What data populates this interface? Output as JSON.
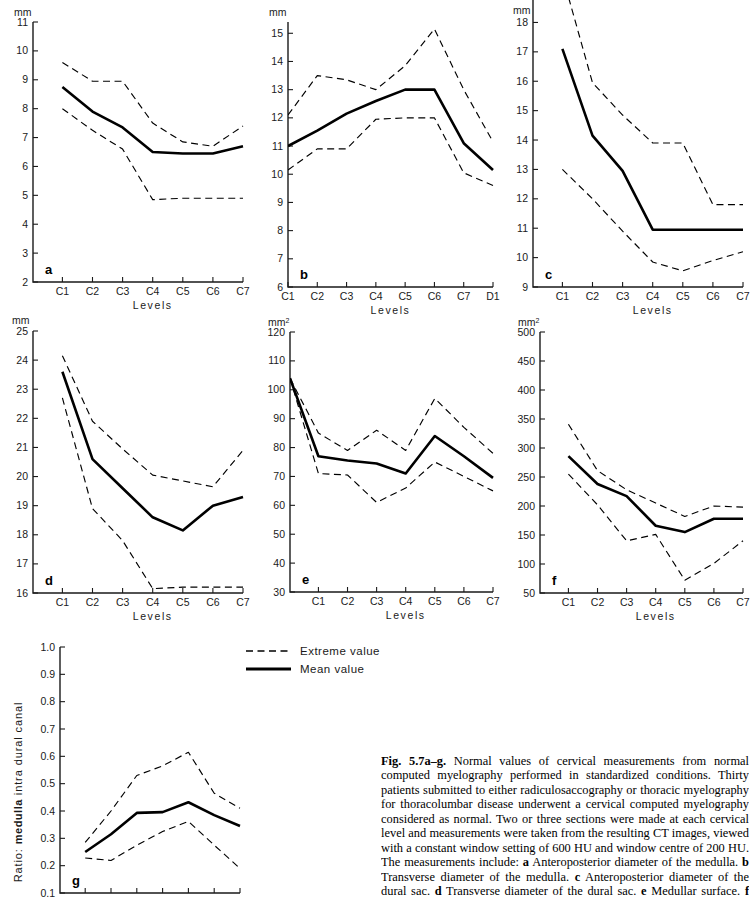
{
  "legend": {
    "extreme_label": "Extreme value",
    "mean_label": "Mean value"
  },
  "caption": {
    "figure_number": "Fig. 5.7a–g.",
    "text": " Normal values of cervical measurements from normal computed myelography performed in standardized conditions. Thirty patients submitted to either radiculosaccography or thoracic myelography for thoracolumbar disease underwent a cervical computed myelography considered as normal. Two or three sections were made at each cervical level and measurements were taken from the resulting CT images, viewed with a constant window setting of 600 HU and window centre of 200 HU. The measurements include: ",
    "items": [
      {
        "letter": "a",
        "text": " Anteroposterior diameter of the medulla. "
      },
      {
        "letter": "b",
        "text": " Transverse diameter of the medulla. "
      },
      {
        "letter": "c",
        "text": " Anteroposterior diameter of the dural sac. "
      },
      {
        "letter": "d",
        "text": " Transverse diameter of the dural sac. "
      },
      {
        "letter": "e",
        "text": " Medullar surface. "
      },
      {
        "letter": "f",
        "text": " Intradural canalar surface."
      }
    ]
  },
  "chart_data": [
    {
      "id": "a",
      "type": "line",
      "panel_letter": "a",
      "unit": "mm",
      "xlabel": "Levels",
      "ylabel": "",
      "categories": [
        "C1",
        "C2",
        "C3",
        "C4",
        "C5",
        "C6",
        "C7"
      ],
      "ylim": [
        2,
        11
      ],
      "yticks": [
        2,
        3,
        4,
        5,
        6,
        7,
        8,
        9,
        10,
        11
      ],
      "ytick_labels": [
        "2",
        "3",
        "4",
        "5",
        "6",
        "7",
        "8",
        "9",
        "10",
        "11"
      ],
      "grid": false,
      "series": [
        {
          "name": "Extreme value upper",
          "style": "dashed",
          "values": [
            9.6,
            8.95,
            8.95,
            7.5,
            6.85,
            6.7,
            7.4
          ]
        },
        {
          "name": "Mean value",
          "style": "solid",
          "values": [
            8.75,
            7.9,
            7.35,
            6.5,
            6.45,
            6.45,
            6.7
          ]
        },
        {
          "name": "Extreme value lower",
          "style": "dashed",
          "values": [
            8.0,
            7.25,
            6.6,
            4.85,
            4.9,
            4.9,
            4.9
          ]
        }
      ]
    },
    {
      "id": "b",
      "type": "line",
      "panel_letter": "b",
      "unit": "mm",
      "xlabel": "Levels",
      "ylabel": "",
      "categories": [
        "C1",
        "C2",
        "C3",
        "C4",
        "C5",
        "C6",
        "C7",
        "D1"
      ],
      "ylim": [
        6,
        15.4
      ],
      "yticks": [
        6,
        7,
        8,
        9,
        10,
        11,
        12,
        13,
        14,
        15
      ],
      "ytick_labels": [
        "6",
        "7",
        "8",
        "9",
        "10",
        "11",
        "12",
        "13",
        "14",
        "15"
      ],
      "grid": false,
      "series": [
        {
          "name": "Extreme value upper",
          "style": "dashed",
          "values": [
            12.1,
            13.5,
            13.35,
            13.0,
            13.85,
            15.15,
            13.0,
            11.15
          ]
        },
        {
          "name": "Mean value",
          "style": "solid",
          "values": [
            11.0,
            11.55,
            12.15,
            12.6,
            13.0,
            13.0,
            11.1,
            10.15
          ]
        },
        {
          "name": "Extreme value lower",
          "style": "dashed",
          "values": [
            10.15,
            10.9,
            10.9,
            11.95,
            12.0,
            12.0,
            10.05,
            9.6
          ]
        }
      ]
    },
    {
      "id": "c",
      "type": "line",
      "panel_letter": "c",
      "unit": "mm",
      "xlabel": "Levels",
      "ylabel": "",
      "categories": [
        "C1",
        "C2",
        "C3",
        "C4",
        "C5",
        "C6",
        "C7"
      ],
      "ylim": [
        9,
        18.9
      ],
      "yticks": [
        9,
        10,
        11,
        12,
        13,
        14,
        15,
        16,
        17,
        18
      ],
      "ytick_labels": [
        "9",
        "10",
        "11",
        "12",
        "13",
        "14",
        "15",
        "16",
        "17",
        "18"
      ],
      "grid": false,
      "series": [
        {
          "name": "Extreme value upper",
          "style": "dashed",
          "values": [
            19.6,
            15.95,
            14.85,
            13.9,
            13.9,
            11.8,
            11.8
          ]
        },
        {
          "name": "Mean value",
          "style": "solid",
          "values": [
            17.1,
            14.15,
            12.95,
            10.95,
            10.95,
            10.95,
            10.95
          ]
        },
        {
          "name": "Extreme value lower",
          "style": "dashed",
          "values": [
            13.0,
            12.0,
            10.9,
            9.85,
            9.55,
            9.9,
            10.2
          ]
        }
      ]
    },
    {
      "id": "d",
      "type": "line",
      "panel_letter": "d",
      "unit": "mm",
      "xlabel": "Levels",
      "ylabel": "",
      "categories": [
        "C1",
        "C2",
        "C3",
        "C4",
        "C5",
        "C6",
        "C7"
      ],
      "ylim": [
        16,
        25
      ],
      "yticks": [
        16,
        17,
        18,
        19,
        20,
        21,
        22,
        23,
        24,
        25
      ],
      "ytick_labels": [
        "16",
        "17",
        "18",
        "19",
        "20",
        "21",
        "22",
        "23",
        "24",
        "25"
      ],
      "grid": false,
      "series": [
        {
          "name": "Extreme value upper",
          "style": "dashed",
          "values": [
            24.15,
            21.9,
            20.95,
            20.05,
            19.85,
            19.65,
            20.9
          ]
        },
        {
          "name": "Mean value",
          "style": "solid",
          "values": [
            23.6,
            20.6,
            19.6,
            18.6,
            18.15,
            19.0,
            19.3
          ]
        },
        {
          "name": "Extreme value lower",
          "style": "dashed",
          "values": [
            22.7,
            18.9,
            17.8,
            16.15,
            16.2,
            16.2,
            16.2
          ]
        }
      ]
    },
    {
      "id": "e",
      "type": "line",
      "panel_letter": "e",
      "unit": "mm2",
      "xlabel": "Levels",
      "ylabel": "",
      "categories": [
        "C1",
        "C2",
        "C3",
        "C4",
        "C5",
        "C6",
        "C7"
      ],
      "ylim": [
        30,
        120
      ],
      "yticks": [
        30,
        40,
        50,
        60,
        70,
        80,
        90,
        100,
        110,
        120
      ],
      "ytick_labels": [
        "30",
        "40",
        "50",
        "60",
        "70",
        "80",
        "90",
        "100",
        "110",
        "120"
      ],
      "grid": false,
      "origin_value": 104,
      "series": [
        {
          "name": "Extreme value upper",
          "style": "dashed",
          "values": [
            85,
            79,
            86,
            79,
            97,
            87,
            78
          ]
        },
        {
          "name": "Mean value",
          "style": "solid",
          "values": [
            77,
            75.5,
            74.5,
            71,
            84,
            77,
            69.5
          ]
        },
        {
          "name": "Extreme value lower",
          "style": "dashed",
          "values": [
            71,
            70.5,
            61,
            66,
            75,
            70,
            65
          ]
        }
      ]
    },
    {
      "id": "f",
      "type": "line",
      "panel_letter": "f",
      "unit": "mm2",
      "xlabel": "Levels",
      "ylabel": "",
      "categories": [
        "C1",
        "C2",
        "C3",
        "C4",
        "C5",
        "C6",
        "C7"
      ],
      "ylim": [
        50,
        500
      ],
      "yticks": [
        50,
        100,
        150,
        200,
        250,
        300,
        350,
        400,
        450,
        500
      ],
      "ytick_labels": [
        "50",
        "100",
        "150",
        "200",
        "250",
        "300",
        "350",
        "400",
        "450",
        "500"
      ],
      "grid": false,
      "series": [
        {
          "name": "Extreme value upper",
          "style": "dashed",
          "values": [
            341,
            261,
            228,
            205,
            182,
            200,
            198
          ]
        },
        {
          "name": "Mean value",
          "style": "solid",
          "values": [
            286,
            238,
            217,
            166,
            155,
            178,
            178
          ]
        },
        {
          "name": "Extreme value lower",
          "style": "dashed",
          "values": [
            255,
            202,
            140,
            151,
            72,
            101,
            140
          ]
        }
      ]
    },
    {
      "id": "g",
      "type": "line",
      "panel_letter": "g",
      "unit": "",
      "xlabel": "",
      "ylabel": "Ratio: medulla intra dural canal",
      "ylabel_bold_word": "medulla",
      "categories": [
        "C1",
        "C2",
        "C3",
        "C4",
        "C5",
        "C6",
        "C7"
      ],
      "ylim": [
        0.1,
        1.0
      ],
      "yticks": [
        0.1,
        0.2,
        0.3,
        0.4,
        0.5,
        0.6,
        0.7,
        0.8,
        0.9,
        1.0
      ],
      "ytick_labels": [
        "0.1",
        "0.2",
        "0.3",
        "0.4",
        "0.5",
        "0.6",
        "0.7",
        "0.8",
        "0.9",
        "1.0"
      ],
      "grid": false,
      "series": [
        {
          "name": "Extreme value upper",
          "style": "dashed",
          "values": [
            0.285,
            0.4,
            0.53,
            0.565,
            0.615,
            0.465,
            0.41
          ]
        },
        {
          "name": "Mean value",
          "style": "solid",
          "values": [
            0.25,
            0.315,
            0.393,
            0.396,
            0.432,
            0.385,
            0.345
          ]
        },
        {
          "name": "Extreme value lower",
          "style": "dashed",
          "values": [
            0.228,
            0.219,
            0.275,
            0.325,
            0.362,
            0.275,
            0.19
          ]
        }
      ]
    }
  ]
}
